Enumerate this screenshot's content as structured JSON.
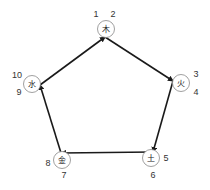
{
  "diagram": {
    "type": "cycle",
    "edge_color": "#1a1a1a",
    "node_stroke": "#888888",
    "nodes": [
      {
        "id": "wood",
        "label": "木",
        "numbers": [
          "1",
          "2"
        ]
      },
      {
        "id": "fire",
        "label": "火",
        "numbers": [
          "3",
          "4"
        ]
      },
      {
        "id": "earth",
        "label": "土",
        "numbers": [
          "5",
          "6"
        ]
      },
      {
        "id": "metal",
        "label": "金",
        "numbers": [
          "7",
          "8"
        ]
      },
      {
        "id": "water",
        "label": "水",
        "numbers": [
          "9",
          "10"
        ]
      }
    ],
    "edges": [
      {
        "from": "wood",
        "to": "fire"
      },
      {
        "from": "fire",
        "to": "earth"
      },
      {
        "from": "earth",
        "to": "metal"
      },
      {
        "from": "metal",
        "to": "water"
      },
      {
        "from": "water",
        "to": "wood"
      }
    ]
  }
}
